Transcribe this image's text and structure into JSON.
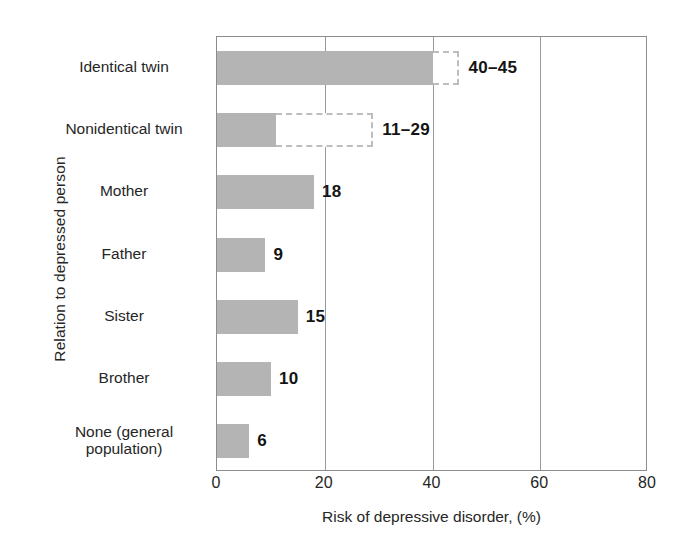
{
  "chart_data": {
    "type": "bar",
    "orientation": "horizontal",
    "title": "",
    "xlabel": "Risk of depressive disorder, (%)",
    "ylabel": "Relation to depressed person",
    "xlim": [
      0,
      80
    ],
    "xticks": [
      0,
      20,
      40,
      60,
      80
    ],
    "xtick_labels": [
      "0",
      "20",
      "40",
      "60",
      "80"
    ],
    "grid": "vertical-only",
    "legend": "none",
    "bar_color": "#b4b4b4",
    "range_outline_color": "#bdbdbd",
    "axis_color": "#8d8d8d",
    "categories": [
      "Identical twin",
      "Nonidentical twin",
      "Mother",
      "Father",
      "Sister",
      "Brother",
      "None (general population)"
    ],
    "bars": [
      {
        "category": "Identical twin",
        "label_lines": [
          "Identical twin"
        ],
        "value": 40,
        "range_low": 40,
        "range_high": 45,
        "is_range": true,
        "data_label": "40–45"
      },
      {
        "category": "Nonidentical twin",
        "label_lines": [
          "Nonidentical twin"
        ],
        "value": 11,
        "range_low": 11,
        "range_high": 29,
        "is_range": true,
        "data_label": "11–29"
      },
      {
        "category": "Mother",
        "label_lines": [
          "Mother"
        ],
        "value": 18,
        "range_low": 18,
        "range_high": 18,
        "is_range": false,
        "data_label": "18"
      },
      {
        "category": "Father",
        "label_lines": [
          "Father"
        ],
        "value": 9,
        "range_low": 9,
        "range_high": 9,
        "is_range": false,
        "data_label": "9"
      },
      {
        "category": "Sister",
        "label_lines": [
          "Sister"
        ],
        "value": 15,
        "range_low": 15,
        "range_high": 15,
        "is_range": false,
        "data_label": "15"
      },
      {
        "category": "Brother",
        "label_lines": [
          "Brother"
        ],
        "value": 10,
        "range_low": 10,
        "range_high": 10,
        "is_range": false,
        "data_label": "10"
      },
      {
        "category": "None (general population)",
        "label_lines": [
          "None (general",
          "population)"
        ],
        "value": 6,
        "range_low": 6,
        "range_high": 6,
        "is_range": false,
        "data_label": "6"
      }
    ]
  }
}
